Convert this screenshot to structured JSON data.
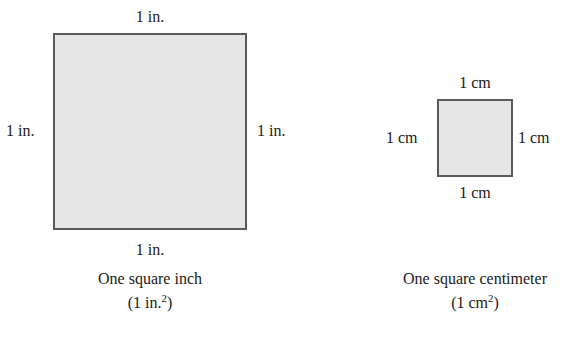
{
  "figure": {
    "background_color": "#ffffff",
    "fill_color": "#e6e6e6",
    "stroke_color": "#5a5a5a",
    "text_color": "#1a1a1a"
  },
  "panels": [
    {
      "id": "square-inch",
      "unit": "in.",
      "labels": {
        "top": "1 in.",
        "left": "1 in.",
        "right": "1 in.",
        "bottom": "1 in."
      },
      "caption_name": "One square inch",
      "caption_area_prefix": "(1 in.",
      "caption_area_exponent": "2",
      "caption_area_suffix": ")"
    },
    {
      "id": "square-centimeter",
      "unit": "cm",
      "labels": {
        "top": "1 cm",
        "left": "1 cm",
        "right": "1 cm",
        "bottom": "1 cm"
      },
      "caption_name": "One square centimeter",
      "caption_area_prefix": "(1 cm",
      "caption_area_exponent": "2",
      "caption_area_suffix": ")"
    }
  ]
}
